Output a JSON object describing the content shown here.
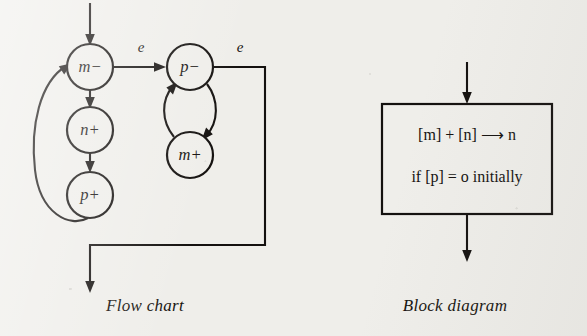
{
  "figure": {
    "background_color": "#efeeea",
    "ink_color": "#14110f"
  },
  "flow_chart": {
    "caption": "Flow chart",
    "nodes": [
      {
        "id": "m-minus",
        "label": "m−",
        "cx": 90,
        "cy": 67,
        "r": 23
      },
      {
        "id": "n-plus",
        "label": "n+",
        "cx": 90,
        "cy": 130,
        "r": 23
      },
      {
        "id": "p-plus",
        "label": "p+",
        "cx": 90,
        "cy": 195,
        "r": 23
      },
      {
        "id": "p-minus",
        "label": "p−",
        "cx": 190,
        "cy": 67,
        "r": 23
      },
      {
        "id": "m-plus",
        "label": "m+",
        "cx": 190,
        "cy": 155,
        "r": 23
      }
    ],
    "edge_labels": [
      {
        "id": "e-left",
        "label": "e",
        "x": 141,
        "y": 52
      },
      {
        "id": "e-right",
        "label": "e",
        "x": 240,
        "y": 52
      }
    ],
    "edges": [
      {
        "id": "entry-arrow",
        "from": "top",
        "to": "m-minus"
      },
      {
        "id": "m-minus-to-n-plus",
        "from": "m-minus",
        "to": "n-plus"
      },
      {
        "id": "n-plus-to-p-plus",
        "from": "n-plus",
        "to": "p-plus"
      },
      {
        "id": "p-plus-to-m-minus",
        "from": "p-plus",
        "to": "m-minus"
      },
      {
        "id": "m-minus-to-p-minus",
        "from": "m-minus",
        "to": "p-minus"
      },
      {
        "id": "p-minus-to-m-plus",
        "from": "p-minus",
        "to": "m-plus"
      },
      {
        "id": "m-plus-to-p-minus",
        "from": "m-plus",
        "to": "p-minus"
      },
      {
        "id": "p-minus-to-exit",
        "from": "p-minus",
        "to": "exit"
      }
    ]
  },
  "block_diagram": {
    "caption": "Block diagram",
    "box": {
      "x": 382,
      "y": 104,
      "width": 170,
      "height": 110
    },
    "line1": "[m] + [n] ⟶ n",
    "line2": "if [p] = o initially",
    "input_arrow": {
      "x": 467,
      "y_start": 62,
      "y_end": 104
    },
    "output_arrow": {
      "x": 467,
      "y_start": 214,
      "y_end": 262
    }
  }
}
